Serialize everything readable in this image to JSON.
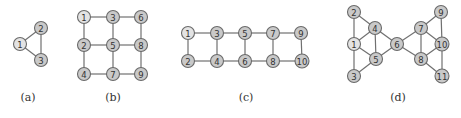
{
  "figure": {
    "node_color": "#c9c9c9",
    "highlight_color": "#e3e3e3",
    "edge_color": "#707070",
    "panels": [
      {
        "caption": "(a)",
        "caption_pos": [
          28,
          101
        ],
        "highlight": [
          "1"
        ],
        "nodes": [
          {
            "id": "1",
            "x": 20,
            "y": 44
          },
          {
            "id": "2",
            "x": 41,
            "y": 28
          },
          {
            "id": "3",
            "x": 41,
            "y": 60
          }
        ],
        "edges": [
          [
            "1",
            "2"
          ],
          [
            "1",
            "3"
          ],
          [
            "2",
            "3"
          ]
        ]
      },
      {
        "caption": "(b)",
        "caption_pos": [
          113,
          101
        ],
        "highlight": [
          "1"
        ],
        "nodes": [
          {
            "id": "1",
            "x": 84,
            "y": 17
          },
          {
            "id": "3",
            "x": 113,
            "y": 17
          },
          {
            "id": "6",
            "x": 141,
            "y": 17
          },
          {
            "id": "2",
            "x": 84,
            "y": 45
          },
          {
            "id": "5",
            "x": 113,
            "y": 45
          },
          {
            "id": "8",
            "x": 141,
            "y": 45
          },
          {
            "id": "4",
            "x": 84,
            "y": 74
          },
          {
            "id": "7",
            "x": 113,
            "y": 74
          },
          {
            "id": "9",
            "x": 141,
            "y": 74
          }
        ],
        "edges": [
          [
            "1",
            "3"
          ],
          [
            "3",
            "6"
          ],
          [
            "2",
            "5"
          ],
          [
            "5",
            "8"
          ],
          [
            "4",
            "7"
          ],
          [
            "7",
            "9"
          ],
          [
            "1",
            "2"
          ],
          [
            "2",
            "4"
          ],
          [
            "3",
            "5"
          ],
          [
            "5",
            "7"
          ],
          [
            "6",
            "8"
          ],
          [
            "8",
            "9"
          ]
        ]
      },
      {
        "caption": "(c)",
        "caption_pos": [
          246,
          101
        ],
        "highlight": [
          "1"
        ],
        "nodes": [
          {
            "id": "1",
            "x": 188,
            "y": 33
          },
          {
            "id": "3",
            "x": 217,
            "y": 33
          },
          {
            "id": "5",
            "x": 245,
            "y": 33
          },
          {
            "id": "7",
            "x": 273,
            "y": 33
          },
          {
            "id": "9",
            "x": 301,
            "y": 33
          },
          {
            "id": "2",
            "x": 188,
            "y": 61
          },
          {
            "id": "4",
            "x": 217,
            "y": 61
          },
          {
            "id": "6",
            "x": 245,
            "y": 61
          },
          {
            "id": "8",
            "x": 273,
            "y": 61
          },
          {
            "id": "10",
            "x": 302,
            "y": 61
          }
        ],
        "edges": [
          [
            "1",
            "3"
          ],
          [
            "3",
            "5"
          ],
          [
            "5",
            "7"
          ],
          [
            "7",
            "9"
          ],
          [
            "2",
            "4"
          ],
          [
            "4",
            "6"
          ],
          [
            "6",
            "8"
          ],
          [
            "8",
            "10"
          ],
          [
            "1",
            "2"
          ],
          [
            "3",
            "4"
          ],
          [
            "5",
            "6"
          ],
          [
            "7",
            "8"
          ],
          [
            "9",
            "10"
          ]
        ]
      },
      {
        "caption": "(d)",
        "caption_pos": [
          398,
          101
        ],
        "highlight": [
          "1"
        ],
        "nodes": [
          {
            "id": "2",
            "x": 354,
            "y": 12
          },
          {
            "id": "1",
            "x": 354,
            "y": 44
          },
          {
            "id": "3",
            "x": 354,
            "y": 76
          },
          {
            "id": "4",
            "x": 375,
            "y": 28
          },
          {
            "id": "5",
            "x": 376,
            "y": 59
          },
          {
            "id": "6",
            "x": 397,
            "y": 44
          },
          {
            "id": "7",
            "x": 421,
            "y": 28
          },
          {
            "id": "8",
            "x": 421,
            "y": 59
          },
          {
            "id": "9",
            "x": 441,
            "y": 12
          },
          {
            "id": "10",
            "x": 442,
            "y": 44
          },
          {
            "id": "11",
            "x": 442,
            "y": 76
          }
        ],
        "edges": [
          [
            "2",
            "1"
          ],
          [
            "1",
            "3"
          ],
          [
            "2",
            "4"
          ],
          [
            "1",
            "4"
          ],
          [
            "1",
            "5"
          ],
          [
            "4",
            "5"
          ],
          [
            "3",
            "5"
          ],
          [
            "4",
            "6"
          ],
          [
            "5",
            "6"
          ],
          [
            "6",
            "7"
          ],
          [
            "6",
            "8"
          ],
          [
            "7",
            "8"
          ],
          [
            "7",
            "9"
          ],
          [
            "9",
            "10"
          ],
          [
            "7",
            "10"
          ],
          [
            "8",
            "10"
          ],
          [
            "10",
            "11"
          ],
          [
            "8",
            "11"
          ]
        ]
      }
    ]
  }
}
